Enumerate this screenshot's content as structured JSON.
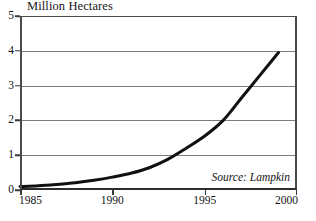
{
  "chart_data": {
    "type": "line",
    "title": "Million Hectares",
    "xlabel": "",
    "ylabel": "Million Hectares",
    "xlim": [
      1985,
      2000
    ],
    "ylim": [
      0,
      5
    ],
    "grid": true,
    "legend": false,
    "annotation": "Source: Lampkin",
    "x_ticks": [
      1985,
      1990,
      1995,
      2000
    ],
    "x_tick_labels": [
      "1985",
      "1990",
      "1995",
      "2000"
    ],
    "y_ticks": [
      0,
      1,
      2,
      3,
      4,
      5
    ],
    "y_tick_labels": [
      "0",
      "1",
      "2",
      "3",
      "4",
      "5"
    ],
    "gridline_values": [
      1,
      2,
      3,
      4
    ],
    "series": [
      {
        "name": "Organic land area",
        "color": "#111111",
        "x": [
          1985,
          1986,
          1987,
          1988,
          1989,
          1990,
          1991,
          1992,
          1993,
          1994,
          1995,
          1996,
          1997,
          1998,
          1999
        ],
        "values": [
          0.1,
          0.12,
          0.16,
          0.21,
          0.28,
          0.37,
          0.48,
          0.64,
          0.88,
          1.2,
          1.55,
          2.0,
          2.65,
          3.3,
          3.95
        ]
      }
    ]
  },
  "axis": {
    "y_title": "Million Hectares"
  },
  "source": {
    "text": "Source: Lampkin"
  }
}
